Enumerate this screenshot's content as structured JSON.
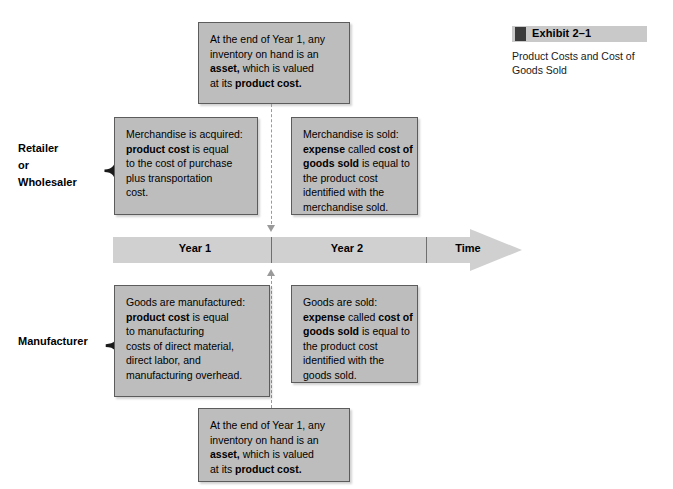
{
  "exhibit": {
    "bullet_icon": "filled-square-icon",
    "title": "Exhibit 2–1",
    "caption_lines": [
      "Product Costs and Cost of",
      "Goods Sold"
    ]
  },
  "groups": {
    "retailer": {
      "label_lines": [
        "Retailer",
        "or",
        "Wholesaler"
      ],
      "brace_glyph": "{"
    },
    "manufacturer": {
      "label_lines": [
        "Manufacturer"
      ],
      "brace_glyph": "{"
    }
  },
  "timeline": {
    "segments": [
      {
        "label": "Year 1"
      },
      {
        "label": "Year 2"
      },
      {
        "label": "Time"
      }
    ],
    "arrow_direction": "right",
    "fill_color": "#d0d0d0"
  },
  "boxes": {
    "top_inventory": {
      "lines": [
        [
          {
            "t": "At the end of Year 1, any",
            "b": false
          }
        ],
        [
          {
            "t": "inventory on hand is an",
            "b": false
          }
        ],
        [
          {
            "t": "asset,",
            "b": true
          },
          {
            "t": " which is valued",
            "b": false
          }
        ],
        [
          {
            "t": "at its ",
            "b": false
          },
          {
            "t": "product cost.",
            "b": true
          }
        ]
      ]
    },
    "retailer_acquired": {
      "lines": [
        [
          {
            "t": "Merchandise is acquired:",
            "b": false
          }
        ],
        [
          {
            "t": "product cost",
            "b": true
          },
          {
            "t": " is equal",
            "b": false
          }
        ],
        [
          {
            "t": "to the cost of purchase",
            "b": false
          }
        ],
        [
          {
            "t": "plus transportation",
            "b": false
          }
        ],
        [
          {
            "t": "cost.",
            "b": false
          }
        ]
      ]
    },
    "retailer_sold": {
      "lines": [
        [
          {
            "t": "Merchandise is sold:",
            "b": false
          }
        ],
        [
          {
            "t": "expense",
            "b": true
          },
          {
            "t": " called ",
            "b": false
          },
          {
            "t": "cost of",
            "b": true
          }
        ],
        [
          {
            "t": "goods sold",
            "b": true
          },
          {
            "t": " is equal to",
            "b": false
          }
        ],
        [
          {
            "t": "the product cost",
            "b": false
          }
        ],
        [
          {
            "t": "identified with the",
            "b": false
          }
        ],
        [
          {
            "t": "merchandise sold.",
            "b": false
          }
        ]
      ]
    },
    "manufacturer_made": {
      "lines": [
        [
          {
            "t": "Goods are manufactured:",
            "b": false
          }
        ],
        [
          {
            "t": "product cost",
            "b": true
          },
          {
            "t": " is equal",
            "b": false
          }
        ],
        [
          {
            "t": "to manufacturing",
            "b": false
          }
        ],
        [
          {
            "t": "costs of direct material,",
            "b": false
          }
        ],
        [
          {
            "t": "direct labor, and",
            "b": false
          }
        ],
        [
          {
            "t": "manufacturing overhead.",
            "b": false
          }
        ]
      ]
    },
    "manufacturer_sold": {
      "lines": [
        [
          {
            "t": "Goods are sold:",
            "b": false
          }
        ],
        [
          {
            "t": "expense",
            "b": true
          },
          {
            "t": " called ",
            "b": false
          },
          {
            "t": "cost of",
            "b": true
          }
        ],
        [
          {
            "t": "goods sold",
            "b": true
          },
          {
            "t": " is equal to",
            "b": false
          }
        ],
        [
          {
            "t": "the product cost",
            "b": false
          }
        ],
        [
          {
            "t": "identified with the",
            "b": false
          }
        ],
        [
          {
            "t": "goods sold.",
            "b": false
          }
        ]
      ]
    },
    "bottom_inventory": {
      "lines": [
        [
          {
            "t": "At the end of Year 1, any",
            "b": false
          }
        ],
        [
          {
            "t": "inventory on hand is an",
            "b": false
          }
        ],
        [
          {
            "t": "asset,",
            "b": true
          },
          {
            "t": " which is valued",
            "b": false
          }
        ],
        [
          {
            "t": "at its ",
            "b": false
          },
          {
            "t": "product cost.",
            "b": true
          }
        ]
      ]
    }
  },
  "colors": {
    "box_fill": "#bdbdbd",
    "box_border": "#5c5c5c",
    "timeline_fill": "#d0d0d0",
    "dashed_connector": "#9a9a9a",
    "exhibit_bar": "#c9c9c9",
    "exhibit_square": "#3b3b3b"
  }
}
